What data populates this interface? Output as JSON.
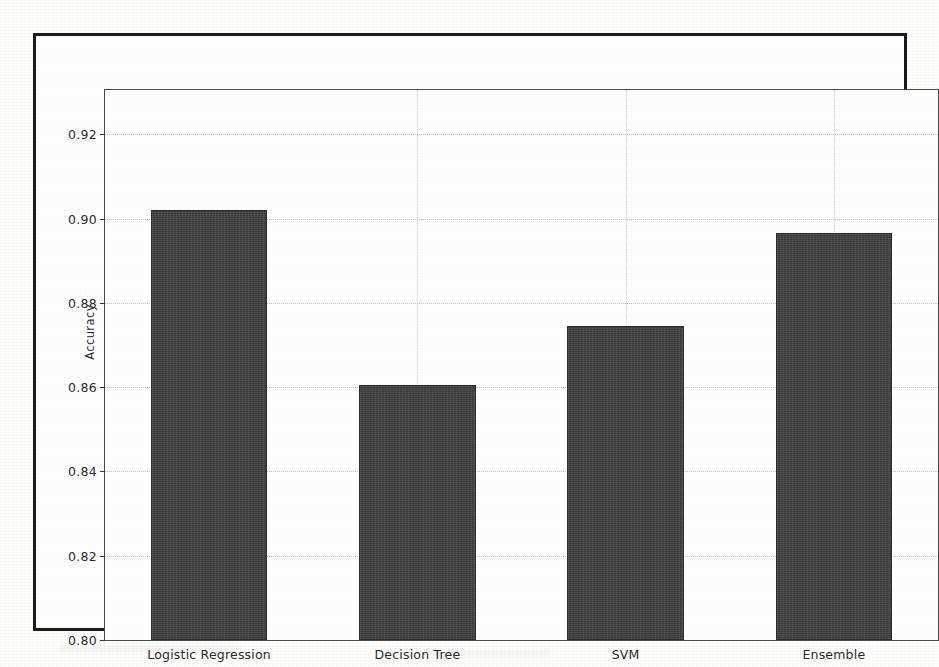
{
  "figure": {
    "frame_color": "#1b1b1b",
    "background": "#ffffff"
  },
  "chart_data": {
    "type": "bar",
    "title": "",
    "xlabel": "",
    "ylabel": "Accuracy",
    "categories": [
      "Logistic Regression",
      "Decision Tree",
      "SVM",
      "Ensemble"
    ],
    "values": [
      0.902,
      0.8605,
      0.8745,
      0.8965
    ],
    "ylim": [
      0.8,
      0.9305
    ],
    "yticks": [
      0.8,
      0.82,
      0.84,
      0.86,
      0.88,
      0.9,
      0.92
    ],
    "ytick_labels": [
      "0.80",
      "0.82",
      "0.84",
      "0.86",
      "0.88",
      "0.90",
      "0.92"
    ],
    "bar_color": "#424242",
    "bar_edge_color": "#2e2e2e",
    "grid": true,
    "grid_style": "dotted",
    "grid_color": "#bdbdbd",
    "legend": null
  }
}
